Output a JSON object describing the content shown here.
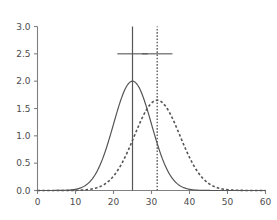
{
  "chart_data": {
    "type": "line",
    "title": "",
    "subtitle": "",
    "xlabel": "",
    "ylabel": "",
    "xlim": [
      0,
      60
    ],
    "ylim": [
      0.0,
      3.0
    ],
    "grid": false,
    "legend": "none",
    "x_ticks": [
      0,
      10,
      20,
      30,
      40,
      50,
      60
    ],
    "x_tick_labels": [
      "0",
      "10",
      "20",
      "30",
      "40",
      "50",
      "60"
    ],
    "y_ticks": [
      0.0,
      0.5,
      1.0,
      1.5,
      2.0,
      2.5,
      3.0
    ],
    "y_tick_labels": [
      "0.0",
      "0.5",
      "1.0",
      "1.5",
      "2.0",
      "2.5",
      "3.0"
    ],
    "series": [
      {
        "name": "solid-curve",
        "style": "solid",
        "color": "#555555",
        "distribution": "normal",
        "mean": 25,
        "sd": 5,
        "peak_value": 2.0,
        "peak_x": 25
      },
      {
        "name": "dashed-curve",
        "style": "dashed",
        "color": "#555555",
        "distribution": "normal",
        "mean": 31.5,
        "sd": 6,
        "peak_value": 1.65,
        "peak_x": 31.5
      }
    ],
    "annotations": [
      {
        "name": "solid-reference-line",
        "type": "vline",
        "x": 25,
        "y_top": 3.0,
        "y_bottom": 0.0,
        "style": "solid",
        "color": "#555555",
        "crossbar_y": 2.5,
        "crossbar_half_width": 4.0
      },
      {
        "name": "dotted-reference-line",
        "type": "vline",
        "x": 31.5,
        "y_top": 3.0,
        "y_bottom": 0.0,
        "style": "dotted",
        "color": "#555555",
        "crossbar_y": 2.5,
        "crossbar_half_width": 4.0
      }
    ]
  },
  "axes": {
    "x_axis_name": "x-axis",
    "y_axis_name": "y-axis"
  }
}
